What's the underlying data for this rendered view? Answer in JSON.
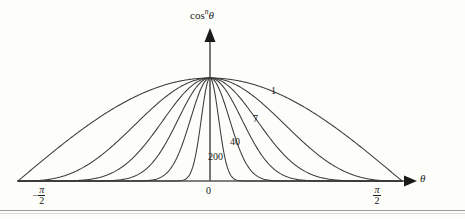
{
  "figure": {
    "background_color": "#fdfdfa",
    "line_color": "#3a3a3a",
    "axis_color": "#555555",
    "text_color": "#1a1a1a",
    "rule_color": "#9a9a96"
  },
  "axes": {
    "y_axis_title": {
      "base": "cos",
      "superscript": "n",
      "variable": "θ",
      "full": "cosⁿθ"
    },
    "x_axis_title": "θ",
    "x_ticks": [
      {
        "name": "neg-half-pi",
        "minus": "−",
        "numerator": "π",
        "denominator": "2",
        "value": -1.5707963
      },
      {
        "name": "zero",
        "label": "0",
        "value": 0
      },
      {
        "name": "pos-half-pi",
        "minus": "",
        "numerator": "π",
        "denominator": "2",
        "value": 1.5707963
      }
    ],
    "x_range": [
      -1.5707963,
      1.5707963
    ],
    "y_range": [
      0,
      1
    ],
    "grid": false,
    "legend": "inline-curve-labels"
  },
  "curve_labels": [
    {
      "name": "1",
      "text": "1"
    },
    {
      "name": "7",
      "text": "7"
    },
    {
      "name": "40",
      "text": "40"
    },
    {
      "name": "200",
      "text": "200"
    }
  ],
  "chart_data": {
    "type": "line",
    "title": "",
    "subtitle": "",
    "xlabel": "θ",
    "ylabel": "cosⁿθ",
    "xlim": [
      -1.5707963,
      1.5707963
    ],
    "ylim": [
      0,
      1
    ],
    "grid": false,
    "legend_position": "inline-labels-on-curves",
    "x_tick_labels": [
      "−π/2",
      "0",
      "π/2"
    ],
    "x_tick_values": [
      -1.5707963,
      0,
      1.5707963
    ],
    "annotations": [
      {
        "text": "1",
        "curve_n": 1
      },
      {
        "text": "7",
        "curve_n": 7
      },
      {
        "text": "40",
        "curve_n": 40
      },
      {
        "text": "200",
        "curve_n": 200
      }
    ],
    "series": [
      {
        "name": "n = 1",
        "n": 1,
        "labeled": true,
        "label": "1",
        "x": [
          -1.5707963,
          -1.3744468,
          -1.1780972,
          -0.9817477,
          -0.7853982,
          -0.5890486,
          -0.3926991,
          -0.1963495,
          0,
          0.1963495,
          0.3926991,
          0.5890486,
          0.7853982,
          0.9817477,
          1.1780972,
          1.3744468,
          1.5707963
        ],
        "values": [
          0,
          0.19509,
          0.38268,
          0.55557,
          0.70711,
          0.83147,
          0.92388,
          0.98079,
          1,
          0.98079,
          0.92388,
          0.83147,
          0.70711,
          0.55557,
          0.38268,
          0.19509,
          0
        ]
      },
      {
        "name": "n = 3",
        "n": 3,
        "labeled": false,
        "label": "",
        "x": [
          -1.5707963,
          -1.3744468,
          -1.1780972,
          -0.9817477,
          -0.7853982,
          -0.5890486,
          -0.3926991,
          -0.1963495,
          0,
          0.1963495,
          0.3926991,
          0.5890486,
          0.7853982,
          0.9817477,
          1.1780972,
          1.3744468,
          1.5707963
        ],
        "values": [
          0,
          0.00743,
          0.05604,
          0.1715,
          0.35355,
          0.57452,
          0.78858,
          0.94346,
          1,
          0.94346,
          0.78858,
          0.57452,
          0.35355,
          0.1715,
          0.05604,
          0.00743,
          0
        ]
      },
      {
        "name": "n = 7",
        "n": 7,
        "labeled": true,
        "label": "7",
        "x": [
          -1.5707963,
          -1.3744468,
          -1.1780972,
          -0.9817477,
          -0.7853982,
          -0.5890486,
          -0.3926991,
          -0.1963495,
          0,
          0.1963495,
          0.3926991,
          0.5890486,
          0.7853982,
          0.9817477,
          1.1780972,
          1.3744468,
          1.5707963
        ],
        "values": [
          0,
          1.08e-05,
          0.00123,
          0.01634,
          0.08839,
          0.27349,
          0.5412,
          0.86955,
          1,
          0.86955,
          0.5412,
          0.27349,
          0.08839,
          0.01634,
          0.00123,
          1.08e-05,
          0
        ]
      },
      {
        "name": "n = 15",
        "n": 15,
        "labeled": false,
        "label": "",
        "x": [
          -1.5707963,
          -1.3744468,
          -1.1780972,
          -0.9817477,
          -0.7853982,
          -0.5890486,
          -0.3926991,
          -0.1963495,
          0,
          0.1963495,
          0.3926991,
          0.5890486,
          0.7853982,
          0.9817477,
          1.1780972,
          1.3744468,
          1.5707963
        ],
        "values": [
          0,
          0.0,
          8e-07,
          0.000148,
          0.00552,
          0.05889,
          0.24503,
          0.74115,
          1,
          0.74115,
          0.24503,
          0.05889,
          0.00552,
          0.000148,
          8e-07,
          0.0,
          0
        ]
      },
      {
        "name": "n = 40",
        "n": 40,
        "labeled": true,
        "label": "40",
        "x": [
          -1.5707963,
          -1.3744468,
          -1.1780972,
          -0.9817477,
          -0.7853982,
          -0.5890486,
          -0.3926991,
          -0.1963495,
          0,
          0.1963495,
          0.3926991,
          0.5890486,
          0.7853982,
          0.9817477,
          1.1780972,
          1.3744468,
          1.5707963
        ],
        "values": [
          0,
          0,
          0,
          0.0,
          9e-07,
          0.00062,
          0.04146,
          0.45519,
          1,
          0.45519,
          0.04146,
          0.00062,
          9e-07,
          0.0,
          0,
          0,
          0
        ]
      },
      {
        "name": "n = 200",
        "n": 200,
        "labeled": true,
        "label": "200",
        "x": [
          -1.5707963,
          -1.3744468,
          -1.1780972,
          -0.9817477,
          -0.7853982,
          -0.5890486,
          -0.3926991,
          -0.1963495,
          0,
          0.1963495,
          0.3926991,
          0.5890486,
          0.7853982,
          0.9817477,
          1.1780972,
          1.3744468,
          1.5707963
        ],
        "values": [
          0,
          0,
          0,
          0,
          0,
          0,
          0.0,
          0.01955,
          1,
          0.01955,
          0.0,
          0,
          0,
          0,
          0,
          0,
          0
        ]
      }
    ]
  }
}
